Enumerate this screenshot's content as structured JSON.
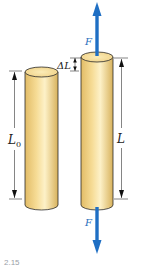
{
  "figure": {
    "labels": {
      "original_length": "L",
      "original_length_sub": "0",
      "stretched_length": "L",
      "delta_length": "ΔL",
      "force_top": "F",
      "force_bottom": "F"
    },
    "colors": {
      "rod_fill": "#f3d88e",
      "rod_highlight": "#fdf1c8",
      "rod_shadow": "#d9b45e",
      "rod_outline": "#2a2a2a",
      "force_arrow": "#1f6fc4",
      "dimension_line": "#333333"
    },
    "caption": "2.15"
  }
}
